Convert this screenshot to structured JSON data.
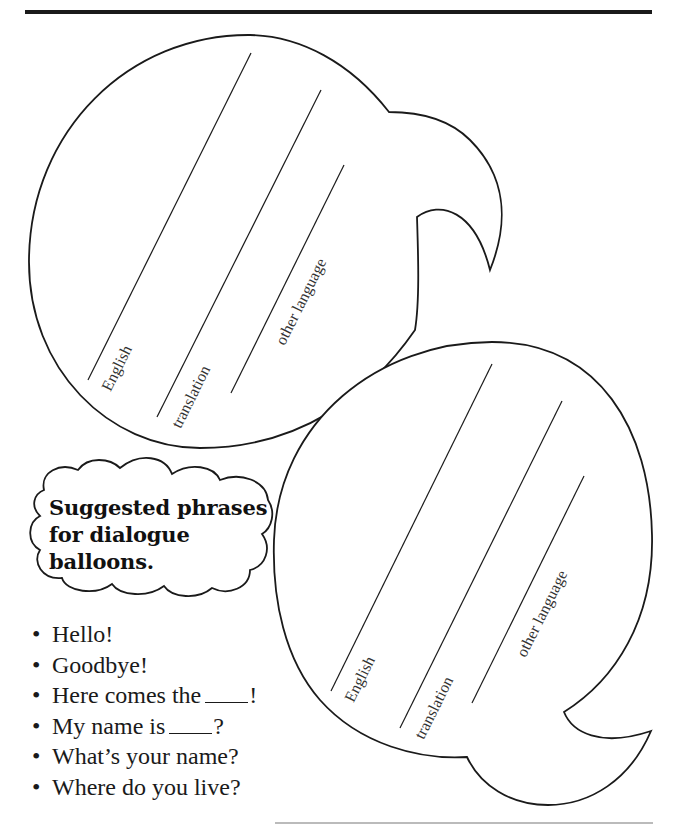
{
  "balloons": [
    {
      "id": "balloon-top",
      "labels": [
        "English",
        "translation",
        "other language"
      ]
    },
    {
      "id": "balloon-bottom",
      "labels": [
        "English",
        "translation",
        "other language"
      ]
    }
  ],
  "cloud": {
    "lines": [
      "Suggested phrases",
      "for dialogue",
      "balloons."
    ]
  },
  "phrases": {
    "bullet": "•",
    "items": [
      {
        "before": "Hello!",
        "blank": false,
        "after": ""
      },
      {
        "before": "Goodbye!",
        "blank": false,
        "after": ""
      },
      {
        "before": "Here comes the",
        "blank": true,
        "after": "!"
      },
      {
        "before": "My name is",
        "blank": true,
        "after": "?"
      },
      {
        "before": "What’s your name?",
        "blank": false,
        "after": ""
      },
      {
        "before": "Where do you live?",
        "blank": false,
        "after": ""
      }
    ]
  },
  "colors": {
    "ink": "#1a1a1a",
    "paper": "#ffffff"
  }
}
